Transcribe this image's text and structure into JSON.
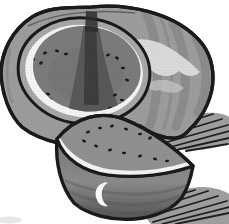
{
  "page": {
    "title": "Watermelon clip-art illustration"
  },
  "illustration": {
    "subject": "watermelon",
    "description": "Grayscale halftone clip-art: a whole watermelon with a wedge cut out showing dark seeded flesh, white rind ring and striped skin; the cut wedge rests in front; hatched cast shadows fall to the right.",
    "parts": {
      "whole_melon": "whole watermelon body with striped skin",
      "cut_face": "exposed cut face with flesh, seeds and rind rings",
      "notch": "dark notch shadow where the wedge was removed",
      "wedge": "cut watermelon wedge in front",
      "shadow_upper": "hatched cast shadow beside the melon",
      "shadow_lower": "hatched cast shadow beneath the wedge"
    }
  },
  "colors": {
    "background": "#ffffff",
    "outline": "#1a1a1a",
    "skin_base": "#9c9c9c",
    "skin_stripe": "#7f7f7f",
    "skin_highlight": "#e0e0e0",
    "skin_highlight_2": "#c9c9c9",
    "rind_gray": "#a7a7a7",
    "rind_white": "#f4f4f4",
    "flesh_dark": "#7b7b7b",
    "flesh_mottle": "#6c6c6c",
    "flesh_medium": "#909090",
    "notch_soft": "#4f4f4f",
    "notch_core": "#2d2d2d",
    "seed": "#191919",
    "wedge_side_top": "#787878",
    "wedge_side_mid": "#8b8b8b",
    "wedge_side_bottom": "#525252",
    "shadow_gray": "#9d9d9d",
    "hatch": "#1f1f1f",
    "highlight_white": "#fbfbfb",
    "smudge": "#e6e6e6"
  },
  "seeds": {
    "face": [
      [
        45,
        53,
        -20
      ],
      [
        57,
        51,
        15
      ],
      [
        66,
        54,
        -10
      ],
      [
        33,
        59,
        25
      ],
      [
        41,
        63,
        -30
      ],
      [
        28,
        88,
        10
      ],
      [
        38,
        91,
        -15
      ],
      [
        48,
        94,
        20
      ],
      [
        33,
        98,
        -25
      ],
      [
        50,
        99,
        5
      ],
      [
        108,
        55,
        -20
      ],
      [
        117,
        58,
        30
      ],
      [
        123,
        68,
        -10
      ],
      [
        127,
        80,
        15
      ],
      [
        115,
        95,
        -20
      ],
      [
        122,
        100,
        10
      ],
      [
        110,
        108,
        -5
      ]
    ],
    "wedge": [
      [
        88,
        132,
        -15
      ],
      [
        100,
        128,
        10
      ],
      [
        112,
        126,
        -20
      ],
      [
        126,
        129,
        15
      ],
      [
        140,
        134,
        -10
      ],
      [
        96,
        146,
        20
      ],
      [
        110,
        150,
        -15
      ],
      [
        124,
        153,
        10
      ],
      [
        140,
        156,
        -20
      ],
      [
        155,
        159,
        15
      ],
      [
        167,
        161,
        -10
      ],
      [
        84,
        141,
        25
      ],
      [
        150,
        138,
        -30
      ]
    ]
  }
}
